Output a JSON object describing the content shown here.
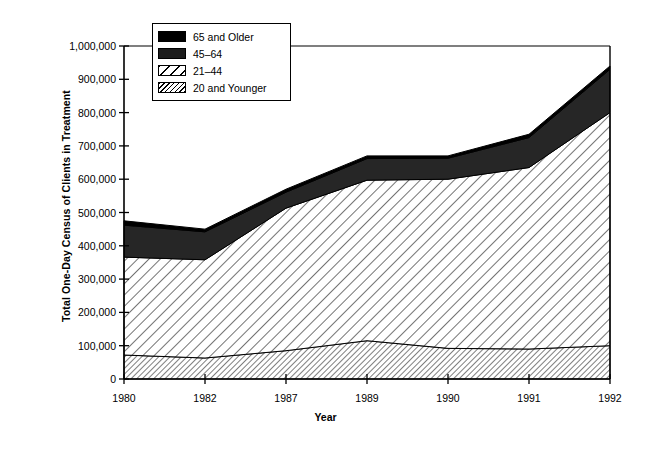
{
  "chart_data": {
    "type": "area",
    "title": "",
    "xlabel": "Year",
    "ylabel": "Total One-Day Census of Clients in Treatment",
    "categories": [
      "1980",
      "1982",
      "1987",
      "1989",
      "1990",
      "1991",
      "1992"
    ],
    "ylim": [
      0,
      1000000
    ],
    "ytick_labels": [
      "0",
      "100,000",
      "200,000",
      "300,000",
      "400,000",
      "500,000",
      "600,000",
      "700,000",
      "800,000",
      "900,000",
      "1,000,000"
    ],
    "ytick_values": [
      0,
      100000,
      200000,
      300000,
      400000,
      500000,
      600000,
      700000,
      800000,
      900000,
      1000000
    ],
    "stacked": true,
    "grid": false,
    "legend_position": "top-left-inside",
    "series": [
      {
        "name": "20 and Younger",
        "pattern": "dense-diagonal-hatch",
        "values": [
          72000,
          63000,
          85000,
          115000,
          92000,
          90000,
          100000
        ]
      },
      {
        "name": "21–44",
        "pattern": "sparse-diagonal-hatch",
        "values": [
          294000,
          295000,
          428000,
          482000,
          508000,
          545000,
          700000
        ]
      },
      {
        "name": "45–64",
        "pattern": "dark-solid",
        "values": [
          96000,
          84000,
          48000,
          65000,
          63000,
          90000,
          130000
        ]
      },
      {
        "name": "65 and Older",
        "pattern": "black-solid",
        "values": [
          13000,
          8000,
          9000,
          8000,
          7000,
          10000,
          10000
        ]
      }
    ],
    "series_totals": [
      475000,
      450000,
      570000,
      670000,
      670000,
      735000,
      940000
    ]
  },
  "legend": {
    "items": [
      {
        "label": "65 and Older",
        "swatch": "black-solid-swatch"
      },
      {
        "label": "45–64",
        "swatch": "dark-solid-swatch"
      },
      {
        "label": "21–44",
        "swatch": "sparse-hatch-swatch"
      },
      {
        "label": "20 and Younger",
        "swatch": "dense-hatch-swatch"
      }
    ]
  },
  "colors": {
    "axis": "#000000",
    "band_65_older": "#000000",
    "band_45_64": "#262626",
    "background": "#ffffff"
  }
}
